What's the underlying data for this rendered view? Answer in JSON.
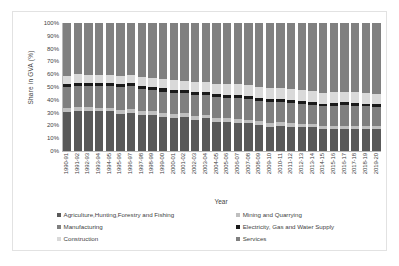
{
  "chart_data": {
    "type": "bar",
    "subtype": "100% stacked column",
    "title": "",
    "xlabel": "Year",
    "ylabel": "Share in GVA  (%)",
    "ylim": [
      0,
      100
    ],
    "yticks": [
      "0%",
      "10%",
      "20%",
      "30%",
      "40%",
      "50%",
      "60%",
      "70%",
      "80%",
      "90%",
      "100%"
    ],
    "grid": false,
    "legend_position": "bottom",
    "categories": [
      "1990-91",
      "1991-92",
      "1992-93",
      "1993-94",
      "1994-95",
      "1995-96",
      "1996-97",
      "1997-98",
      "1998-99",
      "1999-00",
      "2000-01",
      "2001-02",
      "2002-03",
      "2003-04",
      "2004-05",
      "2005-06",
      "2006-07",
      "2007-08",
      "2008-09",
      "2009-10",
      "2010-11",
      "2011-12",
      "2012-13",
      "2013-14",
      "2014-15",
      "2015-16",
      "2016-17",
      "2017-18",
      "2018-19",
      "2019-20"
    ],
    "series": [
      {
        "name": "Agriculture,Hunting,Forestry and Fishing",
        "color": "#595959",
        "values": [
          30.5,
          31.5,
          31.5,
          31.0,
          31.0,
          29.0,
          30.0,
          28.0,
          28.5,
          26.5,
          26.0,
          26.5,
          24.5,
          25.5,
          23.0,
          22.5,
          22.0,
          21.5,
          20.5,
          19.0,
          19.5,
          19.0,
          18.5,
          18.5,
          17.0,
          17.0,
          17.5,
          17.5,
          17.0,
          17.0
        ]
      },
      {
        "name": "Mining and Quarrying",
        "color": "#bfbfbf",
        "values": [
          3.0,
          3.0,
          3.0,
          3.0,
          3.0,
          3.0,
          3.0,
          3.0,
          3.0,
          3.0,
          3.0,
          3.0,
          3.0,
          3.0,
          3.0,
          3.0,
          3.0,
          2.8,
          2.8,
          2.8,
          2.8,
          2.6,
          2.6,
          2.6,
          2.4,
          2.4,
          2.4,
          2.4,
          2.4,
          2.4
        ]
      },
      {
        "name": "Manufacturing",
        "color": "#7f7f7f",
        "values": [
          16.5,
          16.5,
          16.0,
          16.5,
          16.5,
          18.0,
          17.5,
          17.5,
          16.5,
          17.0,
          16.5,
          15.5,
          16.5,
          15.5,
          16.0,
          16.0,
          16.5,
          16.5,
          16.0,
          16.5,
          16.0,
          16.0,
          15.5,
          15.0,
          15.5,
          16.0,
          16.0,
          15.5,
          15.5,
          15.0
        ]
      },
      {
        "name": "Electricity, Gas and Water Supply",
        "color": "#1a1a1a",
        "values": [
          2.5,
          2.5,
          2.5,
          2.5,
          2.5,
          2.5,
          2.5,
          2.4,
          2.4,
          2.4,
          2.4,
          2.4,
          2.4,
          2.4,
          2.3,
          2.3,
          2.3,
          2.2,
          2.2,
          2.2,
          2.2,
          2.2,
          2.2,
          2.2,
          2.2,
          2.2,
          2.2,
          2.2,
          2.2,
          2.2
        ]
      },
      {
        "name": "Construction",
        "color": "#d9d9d9",
        "values": [
          6.5,
          6.5,
          6.5,
          6.5,
          6.5,
          6.5,
          6.5,
          7.0,
          7.0,
          7.5,
          7.5,
          7.5,
          7.5,
          7.5,
          8.0,
          8.2,
          8.2,
          8.5,
          8.5,
          8.5,
          8.5,
          8.8,
          8.8,
          8.8,
          8.5,
          8.3,
          8.0,
          8.2,
          8.2,
          8.2
        ]
      },
      {
        "name": "Services",
        "color": "#808080",
        "values": [
          41.0,
          40.0,
          40.5,
          40.5,
          40.5,
          41.0,
          40.5,
          42.1,
          42.6,
          43.6,
          44.6,
          45.1,
          46.1,
          46.1,
          47.7,
          48.0,
          48.0,
          48.5,
          50.0,
          51.0,
          51.0,
          51.4,
          52.4,
          52.9,
          54.4,
          54.1,
          53.9,
          54.2,
          54.7,
          55.2
        ]
      }
    ]
  }
}
